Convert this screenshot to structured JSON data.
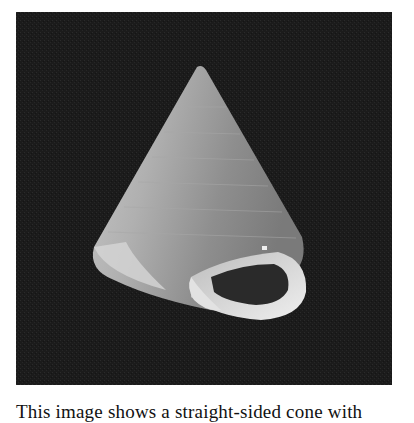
{
  "figure": {
    "colors": {
      "background": "#1b1b1b",
      "shell_light": "#d8d8d8",
      "shell_mid": "#9a9a9a",
      "aperture": "#2a2a2a"
    }
  },
  "caption": {
    "text": "This image shows a straight-sided cone with"
  }
}
